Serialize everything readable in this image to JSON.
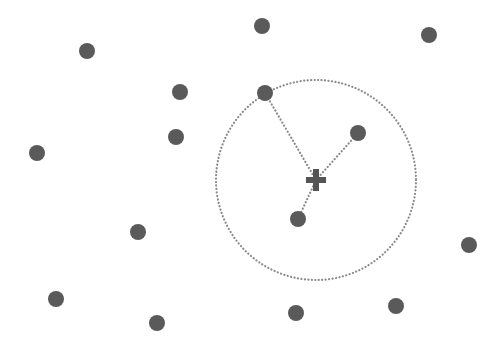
{
  "diagram": {
    "type": "k-nearest-neighbors",
    "background": "#ffffff",
    "point_color": "#5a5a5a",
    "point_radius": 8,
    "line_color": "#8a8a8a",
    "query": {
      "x": 316,
      "y": 180,
      "marker": "plus",
      "color": "#555555"
    },
    "neighborhood_circle": {
      "cx": 316,
      "cy": 180,
      "r": 100,
      "style": "dotted",
      "color": "#8a8a8a"
    },
    "points": [
      {
        "x": 87,
        "y": 51
      },
      {
        "x": 262,
        "y": 26
      },
      {
        "x": 429,
        "y": 35
      },
      {
        "x": 180,
        "y": 92
      },
      {
        "x": 265,
        "y": 93
      },
      {
        "x": 176,
        "y": 137
      },
      {
        "x": 358,
        "y": 133
      },
      {
        "x": 37,
        "y": 153
      },
      {
        "x": 298,
        "y": 219
      },
      {
        "x": 138,
        "y": 232
      },
      {
        "x": 469,
        "y": 245
      },
      {
        "x": 56,
        "y": 299
      },
      {
        "x": 157,
        "y": 323
      },
      {
        "x": 296,
        "y": 313
      },
      {
        "x": 396,
        "y": 306
      }
    ],
    "neighbor_indices": [
      4,
      6,
      8
    ]
  }
}
